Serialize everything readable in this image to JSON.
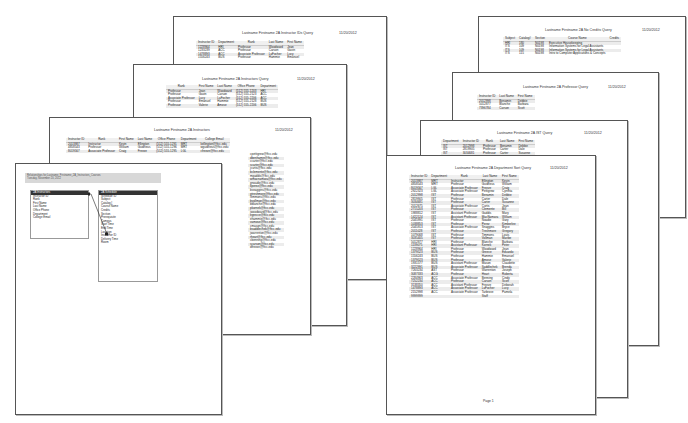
{
  "left_stack": {
    "page1": {
      "title": "Lastname Firstname 2A Instructor IDs Query",
      "date": "11/20/2012",
      "columns": [
        "Instructor ID",
        "Department",
        "Rank",
        "Last Name",
        "First Name"
      ],
      "rows": [
        [
          "1228964",
          "HRI",
          "Professor",
          "Woodward",
          "Jean"
        ],
        [
          "1233239",
          "ACC",
          "Professor",
          "Carson",
          "Gavin"
        ],
        [
          "1478893",
          "ACC",
          "Associate Professor",
          "LaFocher",
          "Lucy"
        ],
        [
          "1556243",
          "BUS",
          "Professor",
          "Hammie",
          "Emanuel"
        ]
      ]
    },
    "page2": {
      "title": "Lastname Firstname 2A Instructors Query",
      "date": "11/20/2012",
      "columns": [
        "Rank",
        "First Name",
        "Last Name",
        "Office Phone",
        "Department"
      ],
      "rows": [
        [
          "Professor",
          "Jean",
          "Woodward",
          "(512) 555-1203",
          "HRI"
        ],
        [
          "Professor",
          "Gavin",
          "Carson",
          "(512) 555-2123",
          "ACC"
        ],
        [
          "Associate Professor",
          "Lucy",
          "LaFocher",
          "(512) 555-2206",
          "ACC"
        ],
        [
          "Professor",
          "Emanuel",
          "Hammie",
          "(512) 555-2128",
          "BUS"
        ],
        [
          "Professor",
          "Valerie",
          "Amose",
          "(512) 555-2206",
          "BUS"
        ]
      ]
    },
    "page3": {
      "title": "Lastname Firstname 2A Instructors",
      "date": "11/20/2012",
      "columns": [
        "Instructor ID",
        "Rank",
        "First Name",
        "Last Name",
        "Office Phone",
        "Department",
        "College Email"
      ],
      "rows": [
        [
          "2013987",
          "Instructor",
          "Kevin",
          "Ellington",
          "(512) 555-1291",
          "MRT",
          "kellington@ftcc.edu"
        ],
        [
          "4858543",
          "Professor",
          "William",
          "Guidrieus",
          "(512) 555-1296",
          "MRT",
          "wguidrieus@ftcc.edu"
        ],
        [
          "8019567",
          "Associate Professor",
          "Craig",
          "Freeze",
          "(512) 555-1295",
          "LGL",
          "cfreeze@ftcc.edu"
        ]
      ],
      "email_column": [
        "kellington@ftcc.edu",
        "wguidrieus@ftcc.edu",
        "cfreeze@ftcc.edu",
        "cpettigrew@ftcc.edu",
        "dbenhamin@ftcc.edu",
        "ccarter@ftcc.edu",
        "scarter@ftcc.edu",
        "jcurtis@ftcc.edu",
        "bclemente@ftcc.edu",
        "mgaddis@ftcc.edu",
        "wmacnamara@ftcc.edu",
        "gnoadie@ftcc.edu",
        "kperez@ftcc.edu",
        "bsnaggins@ftcc.edu",
        "gtreshmore@ftcc.edu",
        "ltimmons@ftcc.edu",
        "bvollman@ftcc.edu",
        "bblanche@ftcc.edu",
        "pkornek@ftcc.edu",
        "jwoodward@ftcc.edu",
        "egrecce@ftcc.edu",
        "ehammie@ftcc.edu",
        "vamose@ftcc.edu",
        "cmason@ftcc.edu",
        "bsaddlechek@ftcc.edu",
        "jwarrenton@ftcc.edu",
        "rheart@ftcc.edu",
        "cbenning@ftcc.edu",
        "scarson@ftcc.edu",
        "dfreeze@ftcc.edu"
      ]
    },
    "page4": {
      "breadcrumb": "Relationships for Lastname_Firstname_2A_Instructors_Courses",
      "subtitle": "Tuesday, November 20, 2012",
      "table_left": {
        "name": "2A Instructors",
        "fields": [
          "Instructor ID",
          "Rank",
          "First Name",
          "Last Name",
          "Office Phone",
          "Department",
          "College Email"
        ]
      },
      "table_right": {
        "name": "2A Schedule",
        "fields": [
          "Schedule ID",
          "Subject",
          "Catalog#",
          "Course Name",
          "Credits",
          "Section",
          "Prerequisite",
          "Campus",
          "Start Time",
          "End Time",
          "Location",
          "Instructor ID",
          "Delivery Time",
          "Room"
        ]
      }
    }
  },
  "right_stack": {
    "page1": {
      "title": "Lastname Firstname 2A No Credits Query",
      "date": "11/20/2012",
      "columns": [
        "Subject",
        "Catalog#",
        "Section",
        "Course Name",
        "Credits"
      ],
      "rows": [
        [
          "HRI",
          "180",
          "N0198",
          "Executive Housekeeping",
          ""
        ],
        [
          "ITS",
          "109",
          "N0198",
          "Information Systems for Legal Assistants",
          ""
        ],
        [
          "ITS",
          "109",
          "N0198",
          "Information Systems for Legal Assistants",
          ""
        ],
        [
          "ITS",
          "115",
          "N0198",
          "Intro to Computer Applications & Concepts",
          ""
        ]
      ]
    },
    "page2": {
      "title": "Lastname Firstname 2A Professor Query",
      "date": "11/20/2012",
      "columns": [
        "Instructor ID",
        "Last Name",
        "First Name"
      ],
      "rows": [
        [
          "2012998",
          "Benamin",
          "Debbie"
        ],
        [
          "5012877",
          "Blanche",
          "Barbara"
        ],
        [
          "7396784",
          "Carson",
          "Scott"
        ]
      ]
    },
    "page3": {
      "title": "Lastname Firstname 2A IST Query",
      "date": "11/20/2012",
      "columns": [
        "Department",
        "Instructor ID",
        "Rank",
        "Last Name",
        "First Name"
      ],
      "rows": [
        [
          "IST",
          "2012998",
          "Professor",
          "Benamin",
          "Debbie"
        ],
        [
          "IST",
          "2819905",
          "Professor",
          "Carter",
          "Dale"
        ],
        [
          "IST",
          "3034681",
          "Professor",
          "Carter",
          "Susanne"
        ]
      ]
    },
    "page4": {
      "title": "Lastname Firstname 2A Department Sort Query",
      "date": "11/20/2012",
      "footer": "Page 1",
      "columns": [
        "Instructor ID",
        "Department",
        "Rank",
        "Last Name",
        "First Name"
      ],
      "rows": [
        [
          "2013987",
          "MRT",
          "Instructor",
          "Ellington",
          "Kevin"
        ],
        [
          "4858543",
          "MRT",
          "Professor",
          "Guidrieus",
          "William"
        ],
        [
          "8019567",
          "LGL",
          "Associate Professor",
          "Freeze",
          "Craig"
        ],
        [
          "2922323",
          "LGL",
          "Associate Professor",
          "Pettigrew",
          "Cynthia"
        ],
        [
          "2012998",
          "IST",
          "Professor",
          "Benamin",
          "Debbie"
        ],
        [
          "2819905",
          "IST",
          "Professor",
          "Carter",
          "Dale"
        ],
        [
          "3034681",
          "IST",
          "Professor",
          "Carter",
          "Susanne"
        ],
        [
          "2012675",
          "IST",
          "Associate Professor",
          "Curtis",
          "Jean"
        ],
        [
          "2715203",
          "IST",
          "Professor",
          "Clemente",
          "Bill"
        ],
        [
          "1988812",
          "IST",
          "Assistant Professor",
          "Gaddis",
          "Mary"
        ],
        [
          "1422124",
          "IST",
          "Assistant Professor",
          "MacNamara",
          "William"
        ],
        [
          "2045991",
          "IST",
          "Professor",
          "Noadie",
          "Gary"
        ],
        [
          "1038853",
          "IST",
          "Professor",
          "Perez",
          "Kimberlee"
        ],
        [
          "2045913",
          "IST",
          "Associate Professor",
          "Snaggins",
          "Bryce"
        ],
        [
          "2011028",
          "IST",
          "Professor",
          "Treshmore",
          "Gregory"
        ],
        [
          "1079068",
          "IST",
          "Professor",
          "Timmons",
          "Louis"
        ],
        [
          "3035405",
          "IST",
          "Professor",
          "Vollman",
          "Maribe"
        ],
        [
          "5012877",
          "HRI",
          "Professor",
          "Blanche",
          "Barbara"
        ],
        [
          "1139075",
          "HRI",
          "Assistant Professor",
          "Kornek",
          "Peter"
        ],
        [
          "1228964",
          "HRI",
          "Professor",
          "Woodward",
          "Jean"
        ],
        [
          "1379523",
          "BUS",
          "Professor",
          "Greece",
          "Eduardo"
        ],
        [
          "1556243",
          "BUS",
          "Professor",
          "Hammie",
          "Emanuel"
        ],
        [
          "1379523",
          "BUS",
          "Professor",
          "Amose",
          "Valerie"
        ],
        [
          "1931577",
          "BUS",
          "Assistant Professor",
          "Mason",
          "Claudette"
        ],
        [
          "3222991",
          "BUS",
          "Associate Professor",
          "Saddlechek",
          "Brenda"
        ],
        [
          "7263234",
          "AST",
          "Professor",
          "Warrenton",
          "Joseph"
        ],
        [
          "3087333",
          "ACG",
          "Professor",
          "Heart",
          "Roberta"
        ],
        [
          "2284963",
          "ACC",
          "Associate Professor",
          "Benning",
          "Cindy"
        ],
        [
          "7252234",
          "ACC",
          "Professor",
          "Carson",
          "Scott"
        ],
        [
          "3138350",
          "ACC",
          "Assistant Professor",
          "Freeze",
          "Deborah"
        ],
        [
          "1478893",
          "ACC",
          "Associate Professor",
          "LaFocher",
          "Lucy"
        ],
        [
          "2152998",
          "ACC",
          "Associate Professor",
          "Tarbrove",
          "Pamela"
        ],
        [
          "9999999",
          "",
          "",
          "Staff",
          ""
        ]
      ]
    }
  }
}
